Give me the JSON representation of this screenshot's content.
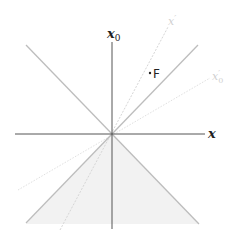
{
  "diagram": {
    "origin": {
      "x": 112,
      "y": 134
    },
    "colors": {
      "axis": "#555555",
      "light_cone": "#bdbdbd",
      "past_cone_fill": "#f1f1f1",
      "boosted_axis": "#dcdcdc",
      "text_dark": "#222222",
      "text_faint": "#d0d0d0"
    },
    "axes": {
      "time": {
        "label": "x",
        "subscript": "0"
      },
      "space": {
        "label": "x"
      }
    },
    "boosted_axes": {
      "space": {
        "label": "x",
        "prime": "′"
      },
      "time": {
        "label": "x",
        "subscript": "0",
        "prime": "′"
      }
    },
    "point": {
      "label": "F",
      "marker": "·"
    },
    "regions": [
      {
        "name": "past-light-cone",
        "shaded": true
      }
    ]
  }
}
